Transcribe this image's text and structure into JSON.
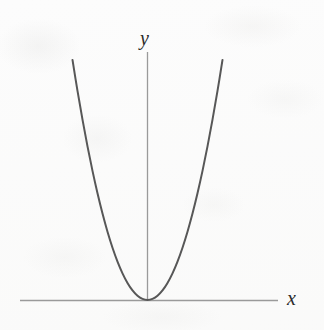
{
  "figure": {
    "kind": "graph-figure",
    "background_color": "#fcfcfc",
    "axis_color": "#9a9a9a",
    "curve_color": "#575757",
    "label_color": "#2a2a2a",
    "labels": {
      "y_axis": "y",
      "x_axis": "x"
    }
  },
  "chart_data": {
    "type": "line",
    "title": "",
    "subtitle": "",
    "xlabel": "x",
    "ylabel": "y",
    "legend": [],
    "annotations": [],
    "grid": false,
    "xticks": [],
    "yticks": [],
    "xlim": [
      -1.5,
      1.5
    ],
    "ylim": [
      0,
      2.4
    ],
    "series": [
      {
        "name": "y = x^2",
        "equation": "y = x^2",
        "x": [
          -1.5,
          -1.4,
          -1.3,
          -1.2,
          -1.1,
          -1.0,
          -0.9,
          -0.8,
          -0.7,
          -0.6,
          -0.5,
          -0.4,
          -0.3,
          -0.2,
          -0.1,
          0.0,
          0.1,
          0.2,
          0.3,
          0.4,
          0.5,
          0.6,
          0.7,
          0.8,
          0.9,
          1.0,
          1.1,
          1.2,
          1.3,
          1.4,
          1.5
        ],
        "y": [
          2.25,
          1.96,
          1.69,
          1.44,
          1.21,
          1.0,
          0.81,
          0.64,
          0.49,
          0.36,
          0.25,
          0.16,
          0.09,
          0.04,
          0.01,
          0.0,
          0.01,
          0.04,
          0.09,
          0.16,
          0.25,
          0.36,
          0.49,
          0.64,
          0.81,
          1.0,
          1.21,
          1.44,
          1.69,
          1.96,
          2.25
        ]
      }
    ],
    "vertex": {
      "x": 0,
      "y": 0
    },
    "axes_drawn": {
      "x_axis_at_y": 0,
      "y_axis_at_x": 0
    }
  }
}
